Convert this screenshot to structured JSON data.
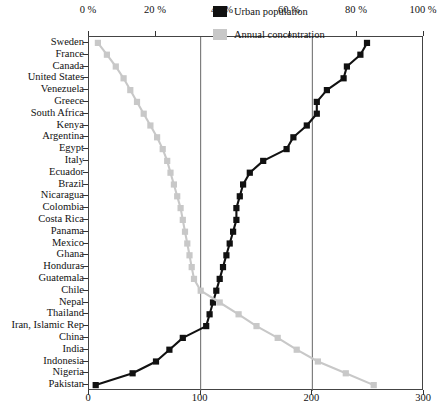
{
  "chart_data": {
    "type": "line",
    "title": "",
    "xlabel": "",
    "ylabel": "",
    "top_axis": {
      "label": "",
      "ticks": [
        "0 %",
        "20 %",
        "40 %",
        "60 %",
        "80 %",
        "100 %"
      ],
      "tick_values": [
        0,
        20,
        40,
        60,
        80,
        100
      ],
      "range": [
        0,
        100
      ],
      "applies_to": "Urban population"
    },
    "bottom_axis": {
      "label": "",
      "ticks": [
        "0",
        "100",
        "200",
        "300"
      ],
      "tick_values": [
        0,
        100,
        200,
        300
      ],
      "range": [
        0,
        300
      ],
      "applies_to": "Annual concentration"
    },
    "grid": "vertical gridlines at 100 and 200 of bottom axis",
    "legend_position": "top-right inside plot",
    "orientation": "horizontal-categories-on-y-axis",
    "categories": [
      "Sweden",
      "France",
      "Canada",
      "United States",
      "Venezuela",
      "Greece",
      "South Africa",
      "Kenya",
      "Argentina",
      "Egypt",
      "Italy",
      "Ecuador",
      "Brazil",
      "Nicaragua",
      "Colombia",
      "Costa Rica",
      "Panama",
      "Mexico",
      "Ghana",
      "Honduras",
      "Guatemala",
      "Chile",
      "Nepal",
      "Thailand",
      "Iran, Islamic Rep",
      "China",
      "India",
      "Indonesia",
      "Nigeria",
      "Pakistan"
    ],
    "series": [
      {
        "name": "Urban population",
        "color": "#111111",
        "axis": "top",
        "unit": "%",
        "values": [
          83,
          81,
          77,
          76,
          71,
          68,
          68,
          65,
          61,
          59,
          52,
          48,
          46,
          45,
          44,
          44,
          43,
          42,
          41,
          40,
          39,
          38,
          37,
          36,
          35,
          28,
          24,
          20,
          13,
          2
        ]
      },
      {
        "name": "Annual concentration",
        "color": "#c8c8c8",
        "axis": "bottom",
        "unit": "",
        "values": [
          8,
          16,
          24,
          31,
          37,
          43,
          49,
          55,
          61,
          66,
          70,
          73,
          76,
          79,
          82,
          84,
          86,
          88,
          90,
          92,
          94,
          100,
          117,
          134,
          150,
          169,
          186,
          205,
          230,
          255
        ]
      }
    ]
  },
  "legend": {
    "items": [
      {
        "label": "Urban population",
        "color": "#111111"
      },
      {
        "label": "Annual concentration",
        "color": "#c8c8c8"
      }
    ]
  }
}
